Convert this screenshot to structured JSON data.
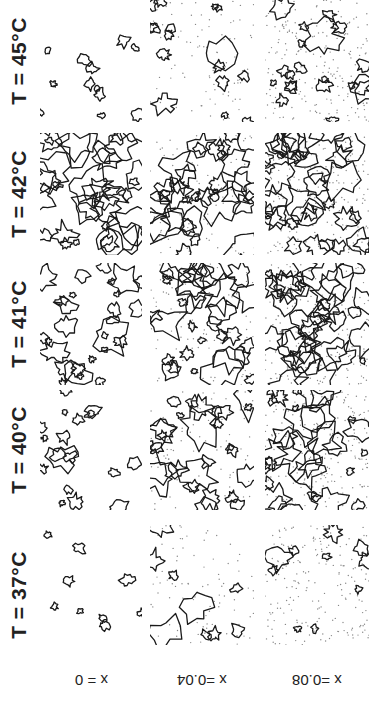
{
  "figure": {
    "rows": [
      {
        "label": "T = 45°C",
        "top": 0,
        "height": 122,
        "density": [
          0.15,
          0.25,
          0.35
        ]
      },
      {
        "label": "T = 42°C",
        "top": 133,
        "height": 122,
        "density": [
          0.7,
          0.75,
          0.75
        ]
      },
      {
        "label": "T = 41°C",
        "top": 263,
        "height": 122,
        "density": [
          0.55,
          0.65,
          0.7
        ]
      },
      {
        "label": "T = 40°C",
        "top": 390,
        "height": 120,
        "density": [
          0.3,
          0.55,
          0.6
        ]
      },
      {
        "label": "T = 37°C",
        "top": 520,
        "height": 150,
        "density": [
          0.08,
          0.08,
          0.1
        ]
      }
    ],
    "columns": [
      {
        "label": "x = 0",
        "left": 40,
        "width": 102,
        "dots": 0
      },
      {
        "label": "x =0.04",
        "left": 150,
        "width": 104,
        "dots": 90
      },
      {
        "label": "x =0.08",
        "left": 265,
        "width": 104,
        "dots": 200
      }
    ]
  },
  "labels": {
    "row_0": "T = 45°C",
    "row_1": "T = 42°C",
    "row_2": "T = 41°C",
    "row_3": "T = 40°C",
    "row_4": "T = 37°C",
    "col_0": "x = 0",
    "col_1": "x =0.04",
    "col_2": "x =0.08"
  }
}
